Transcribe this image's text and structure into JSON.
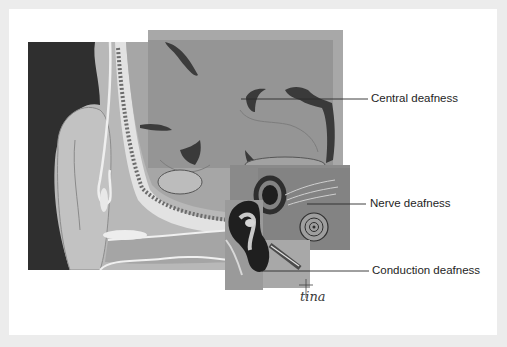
{
  "figure": {
    "labels": [
      {
        "id": "central",
        "text": "Central deafness"
      },
      {
        "id": "nerve",
        "text": "Nerve deafness"
      },
      {
        "id": "conduction",
        "text": "Conduction deafness"
      }
    ],
    "signature": "tina",
    "colors": {
      "page_background": "#ececec",
      "card_background": "#ffffff",
      "dark_background": "#2c2c2c",
      "skin_tone": "#b4b4b4",
      "brain_tissue": "#9a9a9a",
      "highlight_panel": "#8a8a8a",
      "leader_line": "#2a2a2a",
      "label_text": "#1e1e1e"
    }
  }
}
